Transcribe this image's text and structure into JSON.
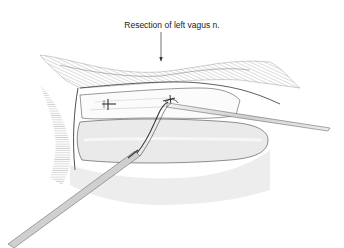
{
  "figure": {
    "callout_label": "Resection of left vagus n.",
    "elements": [
      "arrow-pointer",
      "mediastinal-tissue",
      "vagus-nerve-with-clips",
      "esophagus",
      "grasper-instrument",
      "dissector-instrument"
    ]
  },
  "colors": {
    "ink": "#2a2a2a",
    "hatch": "#8a8a8a",
    "background": "#ffffff"
  }
}
